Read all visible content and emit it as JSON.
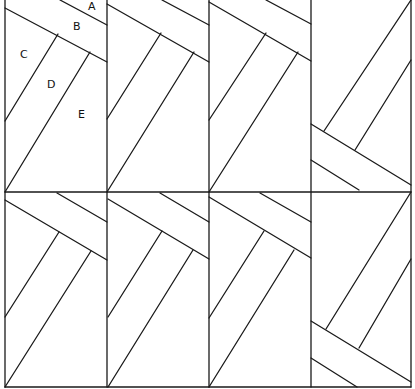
{
  "diagram": {
    "stroke_color": "#1a1a1a",
    "background": "#ffffff",
    "grid": {
      "columns": 4,
      "rows": 2
    },
    "labels": [
      {
        "id": "A",
        "text": "A",
        "x": 88,
        "y": 10
      },
      {
        "id": "B",
        "text": "B",
        "x": 73,
        "y": 30
      },
      {
        "id": "C",
        "text": "C",
        "x": 20,
        "y": 58
      },
      {
        "id": "D",
        "text": "D",
        "x": 47,
        "y": 88
      },
      {
        "id": "E",
        "text": "E",
        "x": 78,
        "y": 118
      }
    ]
  }
}
